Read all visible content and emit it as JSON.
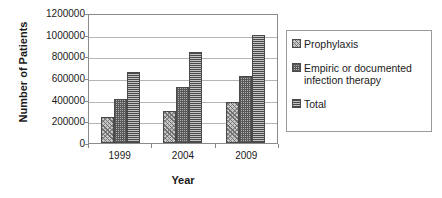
{
  "chart_data": {
    "type": "bar",
    "title": "",
    "xlabel": "Year",
    "ylabel": "Number of Patients",
    "categories": [
      "1999",
      "2004",
      "2009"
    ],
    "series": [
      {
        "name": "Prophylaxis",
        "values": [
          240000,
          300000,
          380000
        ],
        "pattern": "diagonal-hatch",
        "color": "#c9c9c9"
      },
      {
        "name": "Empiric or documented infection therapy",
        "values": [
          410000,
          520000,
          620000
        ],
        "pattern": "checkerboard",
        "color": "#b0b0b0"
      },
      {
        "name": "Total",
        "values": [
          655000,
          840000,
          1000000
        ],
        "pattern": "horizontal-lines",
        "color": "#9a9a9a"
      }
    ],
    "ylim": [
      0,
      1200000
    ],
    "ytick_step": 200000,
    "yticks": [
      1200000,
      1000000,
      800000,
      600000,
      400000,
      200000,
      0
    ],
    "ytick_labels": [
      "1200000",
      "1000000",
      "800000",
      "600000",
      "400000",
      "200000",
      "0"
    ],
    "grid": true,
    "grid_axis": "y",
    "legend_position": "right",
    "plot_border": true
  },
  "legend": {
    "items": [
      {
        "label": "Prophylaxis"
      },
      {
        "label": "Empiric or documented infection therapy"
      },
      {
        "label": "Total"
      }
    ]
  }
}
